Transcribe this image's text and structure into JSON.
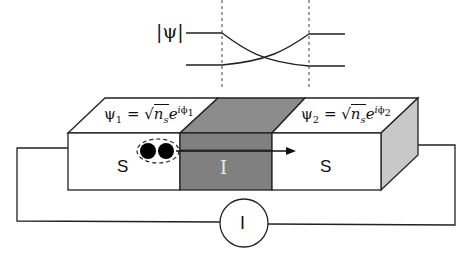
{
  "graph": {
    "ylabel": "|ψ|",
    "description": "Order parameter magnitude across junction: two curves decaying exponentially into the insulator from each side and crossing at the center",
    "boundaries": [
      "left S/I interface",
      "right S/I interface"
    ]
  },
  "junction": {
    "left_electrode": {
      "label": "S",
      "wavefunction": {
        "psi": "ψ",
        "sub": "1",
        "eq": " = ",
        "sqrt_arg": "n",
        "sqrt_sub": "s",
        "exp_base": "e",
        "exp_i": "i",
        "exp_phi": "ϕ",
        "exp_sub": "1"
      }
    },
    "barrier": {
      "label": "I",
      "color": "#808080"
    },
    "right_electrode": {
      "label": "S",
      "wavefunction": {
        "psi": "ψ",
        "sub": "2",
        "eq": " = ",
        "sqrt_arg": "n",
        "sqrt_sub": "s",
        "exp_base": "e",
        "exp_i": "i",
        "exp_phi": "ϕ",
        "exp_sub": "2"
      }
    },
    "cooper_pair": {
      "description": "Cooper pair (two electrons in dashed ellipse) tunneling with arrow through barrier"
    }
  },
  "circuit": {
    "ammeter_label": "I"
  },
  "colors": {
    "line": "#111111",
    "barrier_front": "#808080",
    "barrier_top": "#8c8c8c",
    "side_face": "#c8c8c8",
    "background": "#ffffff"
  }
}
